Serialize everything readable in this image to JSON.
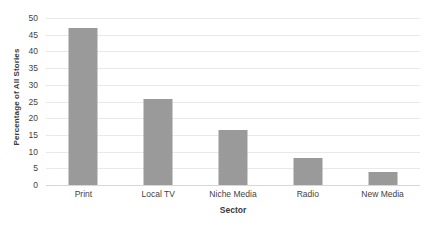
{
  "chart_data": {
    "type": "bar",
    "title": "",
    "xlabel": "Sector",
    "ylabel": "Percentage of All Stories",
    "categories": [
      "Print",
      "Local TV",
      "Niche Media",
      "Radio",
      "New Media"
    ],
    "values": [
      47,
      25.7,
      16.5,
      8,
      4
    ],
    "ylim": [
      0,
      50
    ],
    "ytick_values": [
      0,
      5,
      10,
      15,
      20,
      25,
      30,
      35,
      40,
      45,
      50
    ],
    "ytick_labels": [
      "0",
      "5",
      "10",
      "15",
      "20",
      "25",
      "30",
      "35",
      "40",
      "45",
      "50"
    ],
    "grid": true,
    "legend": false,
    "bar_color": "#9a9a9a",
    "grid_color": "#e9e9e9",
    "axis_color": "#d7d7d7",
    "background": "#ffffff"
  }
}
